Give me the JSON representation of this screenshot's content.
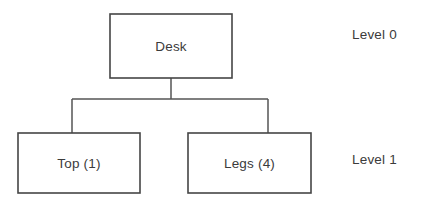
{
  "diagram": {
    "type": "product-structure-tree",
    "background_color": "#ffffff",
    "line_color": "#555555",
    "box_stroke_color": "#454545",
    "box_fill_color": "#ffffff",
    "text_color": "#3b3b3b",
    "nodes": [
      {
        "id": "desk",
        "label": "Desk",
        "level": 0,
        "x": 110,
        "y": 14,
        "width": 122,
        "height": 64
      },
      {
        "id": "top",
        "label": "Top (1)",
        "level": 1,
        "x": 18,
        "y": 133,
        "width": 122,
        "height": 60
      },
      {
        "id": "legs",
        "label": "Legs (4)",
        "level": 1,
        "x": 188,
        "y": 133,
        "width": 123,
        "height": 60
      }
    ],
    "connectors": [
      {
        "id": "desk-stem",
        "d": "M 171 78 L 171 99"
      },
      {
        "id": "bus-line",
        "d": "M 72 99 L 268 99"
      },
      {
        "id": "top-stem",
        "d": "M 72 99 L 72 133"
      },
      {
        "id": "legs-stem",
        "d": "M 268 99 L 268 133"
      }
    ],
    "level_labels": [
      {
        "id": "level-0",
        "text": "Level 0",
        "x": 352,
        "y": 35
      },
      {
        "id": "level-1",
        "text": "Level 1",
        "x": 352,
        "y": 160
      }
    ]
  }
}
